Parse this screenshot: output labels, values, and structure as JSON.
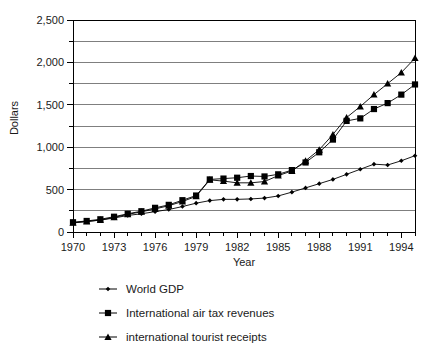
{
  "chart_data": {
    "type": "line",
    "title": "",
    "subtitle": "",
    "xlabel": "Year",
    "ylabel": "Dollars",
    "xlim": [
      1970,
      1995
    ],
    "ylim": [
      0,
      2500
    ],
    "grid": true,
    "grid_axis": "y",
    "grid_step": 250,
    "legend_position": "bottom",
    "y_tick_labels": [
      "0",
      "500",
      "1,000",
      "1,500",
      "2,000",
      "2,500"
    ],
    "y_tick_values": [
      0,
      500,
      1000,
      1500,
      2000,
      2500
    ],
    "x_tick_labels": [
      "1970",
      "1973",
      "1976",
      "1979",
      "1982",
      "1985",
      "1988",
      "1991",
      "1994"
    ],
    "x_tick_values": [
      1970,
      1973,
      1976,
      1979,
      1982,
      1985,
      1988,
      1991,
      1994
    ],
    "x_minor_ticks": [
      1970,
      1971,
      1972,
      1973,
      1974,
      1975,
      1976,
      1977,
      1978,
      1979,
      1980,
      1981,
      1982,
      1983,
      1984,
      1985,
      1986,
      1987,
      1988,
      1989,
      1990,
      1991,
      1992,
      1993,
      1994,
      1995
    ],
    "x": [
      1970,
      1971,
      1972,
      1973,
      1974,
      1975,
      1976,
      1977,
      1978,
      1979,
      1980,
      1981,
      1982,
      1983,
      1984,
      1985,
      1986,
      1987,
      1988,
      1989,
      1990,
      1991,
      1992,
      1993,
      1994,
      1995
    ],
    "series": [
      {
        "name": "World GDP",
        "marker": "diamond",
        "color": "#000000",
        "values": [
          110,
          125,
          140,
          165,
          195,
          215,
          240,
          265,
          300,
          340,
          370,
          385,
          385,
          390,
          400,
          425,
          470,
          520,
          570,
          620,
          680,
          740,
          800,
          790,
          840,
          900
        ]
      },
      {
        "name": "International air tax revenues",
        "marker": "square",
        "color": "#000000",
        "values": [
          115,
          130,
          150,
          180,
          215,
          245,
          285,
          320,
          375,
          430,
          620,
          630,
          640,
          660,
          655,
          680,
          730,
          820,
          940,
          1090,
          1310,
          1340,
          1450,
          1520,
          1620,
          1740
        ]
      },
      {
        "name": "international tourist receipts",
        "marker": "triangle",
        "color": "#000000",
        "values": [
          108,
          122,
          142,
          172,
          208,
          238,
          272,
          310,
          360,
          420,
          615,
          600,
          580,
          580,
          595,
          665,
          720,
          840,
          970,
          1150,
          1350,
          1480,
          1620,
          1750,
          1880,
          2050
        ]
      }
    ]
  },
  "legend": {
    "items": [
      {
        "label": "World GDP",
        "marker": "diamond"
      },
      {
        "label": "International air tax revenues",
        "marker": "square"
      },
      {
        "label": "international tourist receipts",
        "marker": "triangle"
      }
    ]
  },
  "axes": {
    "y_title": "Dollars",
    "x_title": "Year"
  }
}
